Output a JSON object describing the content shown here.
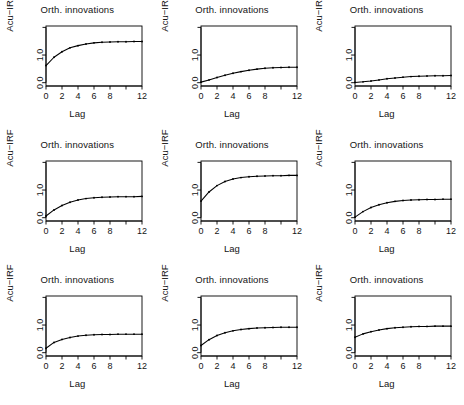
{
  "figure": {
    "layout": "3x3 grid of panels",
    "panel_count": 9,
    "background_color": "#ffffff",
    "line_color": "#000000",
    "point_color": "#000000"
  },
  "axis_labels": {
    "title": "Orth. innovations",
    "ylabel": "Acu−IRF",
    "xlabel": "Lag"
  },
  "x_ticks": [
    "0",
    "2",
    "4",
    "6",
    "8",
    "12"
  ],
  "x_tick_values": [
    0,
    2,
    4,
    6,
    8,
    10,
    12
  ],
  "x_tick_labeled": [
    "0",
    "2",
    "4",
    "6",
    "8",
    "",
    "12"
  ],
  "y_ticks": [
    "0.0",
    "1.0"
  ],
  "y_tick_values": [
    0.0,
    1.0,
    2.0
  ],
  "y_tick_labeled": [
    "0.0",
    "1.0",
    ""
  ],
  "chart_data": [
    {
      "type": "line",
      "panel": 1,
      "row": 1,
      "col": 1,
      "title": "Orth. innovations",
      "xlabel": "Lag",
      "ylabel": "Acu−IRF",
      "x": [
        0,
        1,
        2,
        3,
        4,
        5,
        6,
        7,
        8,
        9,
        10,
        11,
        12
      ],
      "values": [
        0.62,
        0.92,
        1.12,
        1.26,
        1.34,
        1.4,
        1.44,
        1.46,
        1.47,
        1.48,
        1.48,
        1.49,
        1.49
      ],
      "xlim": [
        0,
        12
      ],
      "ylim": [
        -0.12,
        2.05
      ],
      "grid": false,
      "legend": "none",
      "markers": true
    },
    {
      "type": "line",
      "panel": 2,
      "row": 1,
      "col": 2,
      "title": "Orth. innovations",
      "xlabel": "Lag",
      "ylabel": "Acu−IRF",
      "x": [
        0,
        1,
        2,
        3,
        4,
        5,
        6,
        7,
        8,
        9,
        10,
        11,
        12
      ],
      "values": [
        0.02,
        0.1,
        0.19,
        0.27,
        0.34,
        0.4,
        0.45,
        0.49,
        0.52,
        0.54,
        0.55,
        0.56,
        0.56
      ],
      "xlim": [
        0,
        12
      ],
      "ylim": [
        -0.12,
        2.05
      ],
      "grid": false,
      "legend": "none",
      "markers": true
    },
    {
      "type": "line",
      "panel": 3,
      "row": 1,
      "col": 3,
      "title": "Orth. innovations",
      "xlabel": "Lag",
      "ylabel": "Acu−IRF",
      "x": [
        0,
        1,
        2,
        3,
        4,
        5,
        6,
        7,
        8,
        9,
        10,
        11,
        12
      ],
      "values": [
        0.01,
        0.03,
        0.06,
        0.1,
        0.14,
        0.17,
        0.2,
        0.22,
        0.23,
        0.24,
        0.25,
        0.25,
        0.26
      ],
      "xlim": [
        0,
        12
      ],
      "ylim": [
        -0.12,
        2.05
      ],
      "grid": false,
      "legend": "none",
      "markers": true
    },
    {
      "type": "line",
      "panel": 4,
      "row": 2,
      "col": 1,
      "title": "Orth. innovations",
      "xlabel": "Lag",
      "ylabel": "Acu−IRF",
      "x": [
        0,
        1,
        2,
        3,
        4,
        5,
        6,
        7,
        8,
        9,
        10,
        11,
        12
      ],
      "values": [
        0.06,
        0.28,
        0.44,
        0.56,
        0.64,
        0.69,
        0.72,
        0.74,
        0.75,
        0.76,
        0.76,
        0.76,
        0.77
      ],
      "xlim": [
        0,
        12
      ],
      "ylim": [
        -0.12,
        2.05
      ],
      "grid": false,
      "legend": "none",
      "markers": true
    },
    {
      "type": "line",
      "panel": 5,
      "row": 2,
      "col": 2,
      "title": "Orth. innovations",
      "xlabel": "Lag",
      "ylabel": "Acu−IRF",
      "x": [
        0,
        1,
        2,
        3,
        4,
        5,
        6,
        7,
        8,
        9,
        10,
        11,
        12
      ],
      "values": [
        0.6,
        0.93,
        1.16,
        1.31,
        1.4,
        1.45,
        1.48,
        1.5,
        1.51,
        1.52,
        1.52,
        1.53,
        1.53
      ],
      "xlim": [
        0,
        12
      ],
      "ylim": [
        -0.12,
        2.05
      ],
      "grid": false,
      "legend": "none",
      "markers": true
    },
    {
      "type": "line",
      "panel": 6,
      "row": 2,
      "col": 3,
      "title": "Orth. innovations",
      "xlabel": "Lag",
      "ylabel": "Acu−IRF",
      "x": [
        0,
        1,
        2,
        3,
        4,
        5,
        6,
        7,
        8,
        9,
        10,
        11,
        12
      ],
      "values": [
        0.02,
        0.22,
        0.37,
        0.47,
        0.54,
        0.59,
        0.62,
        0.64,
        0.65,
        0.66,
        0.66,
        0.67,
        0.67
      ],
      "xlim": [
        0,
        12
      ],
      "ylim": [
        -0.12,
        2.05
      ],
      "grid": false,
      "legend": "none",
      "markers": true
    },
    {
      "type": "line",
      "panel": 7,
      "row": 3,
      "col": 1,
      "title": "Orth. innovations",
      "xlabel": "Lag",
      "ylabel": "Acu−IRF",
      "x": [
        0,
        1,
        2,
        3,
        4,
        5,
        6,
        7,
        8,
        9,
        10,
        11,
        12
      ],
      "values": [
        0.16,
        0.37,
        0.48,
        0.55,
        0.6,
        0.63,
        0.65,
        0.66,
        0.66,
        0.67,
        0.67,
        0.67,
        0.67
      ],
      "xlim": [
        0,
        12
      ],
      "ylim": [
        -0.12,
        2.05
      ],
      "grid": false,
      "legend": "none",
      "markers": true
    },
    {
      "type": "line",
      "panel": 8,
      "row": 3,
      "col": 2,
      "title": "Orth. innovations",
      "xlabel": "Lag",
      "ylabel": "Acu−IRF",
      "x": [
        0,
        1,
        2,
        3,
        4,
        5,
        6,
        7,
        8,
        9,
        10,
        11,
        12
      ],
      "values": [
        0.26,
        0.47,
        0.62,
        0.72,
        0.79,
        0.84,
        0.87,
        0.89,
        0.9,
        0.91,
        0.92,
        0.92,
        0.92
      ],
      "xlim": [
        0,
        12
      ],
      "ylim": [
        -0.12,
        2.05
      ],
      "grid": false,
      "legend": "none",
      "markers": true
    },
    {
      "type": "line",
      "panel": 9,
      "row": 3,
      "col": 3,
      "title": "Orth. innovations",
      "xlabel": "Lag",
      "ylabel": "Acu−IRF",
      "x": [
        0,
        1,
        2,
        3,
        4,
        5,
        6,
        7,
        8,
        9,
        10,
        11,
        12
      ],
      "values": [
        0.56,
        0.68,
        0.76,
        0.82,
        0.87,
        0.9,
        0.92,
        0.94,
        0.95,
        0.95,
        0.96,
        0.96,
        0.96
      ],
      "xlim": [
        0,
        12
      ],
      "ylim": [
        -0.12,
        2.05
      ],
      "grid": false,
      "legend": "none",
      "markers": true
    }
  ]
}
